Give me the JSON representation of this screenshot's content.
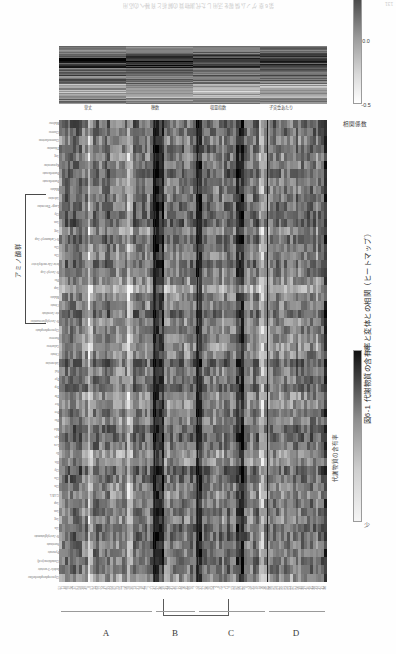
{
  "page": {
    "running_header": "第6章 ゲノム情報を活用した代謝物質の解析と育種への応用",
    "page_number": "131"
  },
  "figure": {
    "caption": "図6-1  代謝物質の含有率と変体との相関（ヒートマップ）",
    "column_group_bracket_label": "アミノ酸群",
    "group_letters": [
      "A",
      "B",
      "C",
      "D"
    ],
    "metabolite_labels": [
      "Glycerophosphocholine",
      "Indole-3-acetate",
      "Glutathione(red)",
      "Pyruvate",
      "Succinate",
      "N-Acetylglutamate",
      "Ala",
      "Arg",
      "Asn",
      "Asp",
      "GABA",
      "Gln",
      "Glu",
      "Gly",
      "His",
      "Ile",
      "Leu",
      "Lys",
      "Met",
      "Phe",
      "Pro",
      "Ser",
      "Thr",
      "Trp",
      "Tyr",
      "Val",
      "Adenosine",
      "Citrate",
      "Galactose",
      "Sucrose",
      "Glycerophosphate",
      "N-Acetylglucosamine",
      "cis-Aconitate",
      "Citrate",
      "Malate",
      "Asp",
      "Phe",
      "N-Acetyl-Asp",
      "beta-Ala-methylester",
      "Gln",
      "Glu",
      "N-Carbamoyl-Asp",
      "Arg",
      "Asn",
      "Gly",
      "Large-Threonine",
      "Adenine",
      "Malate",
      "Pantothenate",
      "Pantothenate",
      "Kynurenine",
      "Arg",
      "Thiamine",
      "Gluconolactone",
      "Glucose",
      "Maltose"
    ],
    "trait_labels": [
      "草丈",
      "穂数",
      "収量指数",
      "子実重あたり"
    ],
    "sample_ticks_A": [
      "52",
      "11",
      "48",
      "19",
      "20",
      "17",
      "61",
      "58",
      "38",
      "49",
      "8",
      "51",
      "15",
      "63",
      "22",
      "14",
      "47",
      "33",
      "64",
      "62",
      "23",
      "55",
      "1",
      "50",
      "28",
      "36",
      "13",
      "31",
      "18",
      "45",
      "29",
      "2",
      "21"
    ],
    "sample_ticks_B": [
      "42",
      "37",
      "40",
      "39",
      "43",
      "34",
      "41",
      "46",
      "12",
      "44",
      "10",
      "35",
      "66",
      "16",
      "7"
    ],
    "sample_ticks_C": [
      "24",
      "32",
      "27",
      "30",
      "26",
      "54",
      "3",
      "4",
      "25",
      "5",
      "11",
      "9",
      "53",
      "59",
      "60",
      "57",
      "56",
      "6",
      "24",
      "35",
      "16",
      "15",
      "10",
      "30"
    ],
    "sample_ticks_D": [
      "65",
      "60",
      "59",
      "58",
      "57",
      "56",
      "55",
      "54",
      "53",
      "52",
      "51",
      "50",
      "49",
      "48",
      "47",
      "46",
      "45",
      "44",
      "43",
      "42",
      "41",
      "40"
    ],
    "colorbars": [
      {
        "name": "correlation",
        "title": "相関係数",
        "ticks": [
          "-0.5",
          "0.0",
          "0.5"
        ],
        "low_color": "#ffffff",
        "high_color": "#151515"
      },
      {
        "name": "metabolite-content",
        "title": "代謝物質の含有率",
        "ticks": [
          "少",
          "多"
        ],
        "low_color": "#f5f5f5",
        "high_color": "#101010"
      }
    ]
  },
  "chart_data": {
    "type": "heatmap",
    "title": "図6-1  代謝物質の含有率と変体との相関（ヒートマップ）",
    "xlabel": "",
    "ylabel": "",
    "grid": false,
    "legend_position": "bottom",
    "panels": [
      {
        "name": "main-heatmap",
        "x_categories_key": "figure.metabolite_labels",
        "y_groups": [
          "A",
          "B",
          "C",
          "D"
        ],
        "n_rows": 94,
        "n_cols": 56,
        "value_range": [
          0,
          1
        ],
        "colormap": "grayscale",
        "note": "代謝物質の含有率（行=系統サンプル、列=代謝物質）"
      },
      {
        "name": "correlation-strip",
        "x_categories_key": "figure.metabolite_labels",
        "y_categories": [
          "草丈",
          "穂数",
          "収量指数",
          "子実重あたり"
        ],
        "n_rows": 4,
        "n_cols": 56,
        "value_range": [
          -0.5,
          0.5
        ],
        "colormap": "grayscale",
        "note": "形質と代謝物質との相関係数"
      }
    ]
  }
}
